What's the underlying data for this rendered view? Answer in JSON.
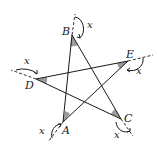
{
  "figure": {
    "vertices": {
      "A": {
        "label": "A",
        "x": 63,
        "y": 122
      },
      "B": {
        "label": "B",
        "x": 72,
        "y": 35
      },
      "C": {
        "label": "C",
        "x": 121,
        "y": 119
      },
      "D": {
        "label": "D",
        "x": 36,
        "y": 79
      },
      "E": {
        "label": "E",
        "x": 128,
        "y": 61
      }
    },
    "segments": [
      [
        "B",
        "A"
      ],
      [
        "B",
        "C"
      ],
      [
        "D",
        "E"
      ],
      [
        "D",
        "C"
      ],
      [
        "E",
        "A"
      ]
    ],
    "angle_labels": {
      "B": "x",
      "D": "x",
      "E": "x",
      "A": "x",
      "C": "x"
    },
    "colors": {
      "line": "#1a1a1a",
      "shade": "#9a9a9a"
    }
  }
}
